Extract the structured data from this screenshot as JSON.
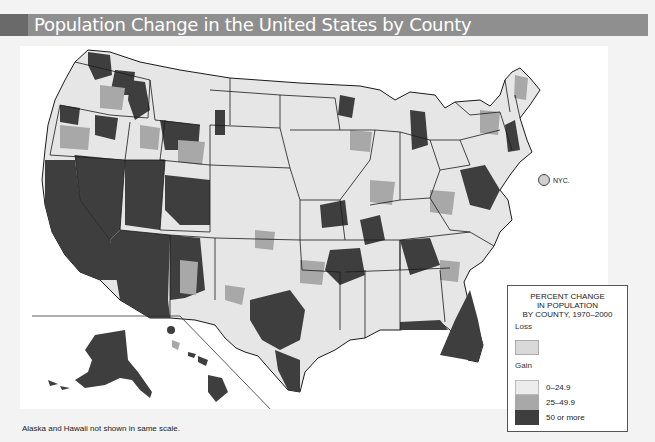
{
  "header": {
    "title": "Population Change in the United States by County"
  },
  "map": {
    "city_marker": {
      "label": "NYC."
    },
    "colors": {
      "loss": "#d9d9d9",
      "gain_0_24_9": "#ececec",
      "gain_25_49_9": "#a8a8a8",
      "gain_50_plus": "#3e3e3e",
      "state_border": "#1a1a1a"
    }
  },
  "legend": {
    "title_lines": [
      "PERCENT CHANGE",
      "IN POPULATION",
      "BY COUNTY, 1970–2000"
    ],
    "loss_heading": "Loss",
    "gain_heading": "Gain",
    "items": [
      {
        "label": "0–24.9",
        "color": "#ececec"
      },
      {
        "label": "25–49.9",
        "color": "#a8a8a8"
      },
      {
        "label": "50 or more",
        "color": "#3e3e3e"
      }
    ]
  },
  "footnote": "Alaska and Hawaii not shown in same scale."
}
